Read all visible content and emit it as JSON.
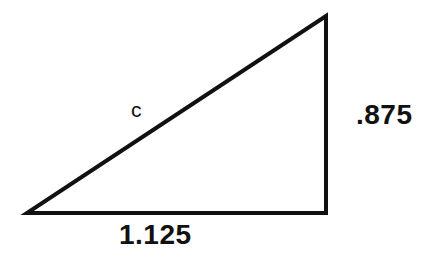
{
  "figure": {
    "kind": "right-triangle-diagram",
    "background_color": "#ffffff",
    "stroke_color": "#111111",
    "stroke_width": 4,
    "canvas": {
      "width": 431,
      "height": 255
    },
    "vertices": {
      "bottom_left": {
        "x": 27,
        "y": 213
      },
      "bottom_right": {
        "x": 326,
        "y": 213
      },
      "top_right": {
        "x": 326,
        "y": 16
      }
    },
    "labels": {
      "hypotenuse": "c",
      "vertical_leg": ".875",
      "base_leg": "1.125"
    }
  },
  "chart_data": {
    "type": "diagram",
    "title": "",
    "shape": "right triangle",
    "sides": [
      {
        "name": "base",
        "label": "1.125",
        "value": 1.125,
        "position": "bottom",
        "pixel_length": 299
      },
      {
        "name": "vertical",
        "label": ".875",
        "value": 0.875,
        "position": "right",
        "pixel_length": 197
      },
      {
        "name": "hypotenuse",
        "label": "c",
        "value": null,
        "position": "upper-left-diagonal",
        "pixel_length": 358
      }
    ],
    "right_angle_at": "bottom_right"
  }
}
